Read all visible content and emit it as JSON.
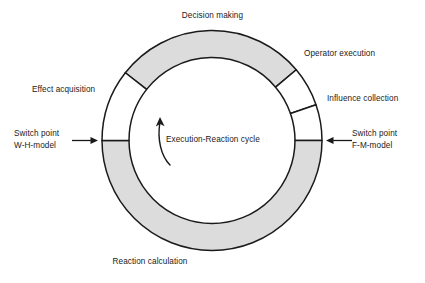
{
  "diagram": {
    "title": "Execution-Reaction cycle",
    "center_label": "Execution-Reaction cycle",
    "colors": {
      "segment_filled": "#dcdcdc",
      "segment_empty": "#ffffff",
      "stroke": "#1a1a1a",
      "text": "#1a1a1a",
      "background": "#ffffff"
    },
    "ring": {
      "center_x": 212,
      "center_y": 140.5,
      "outer_radius": 110,
      "inner_radius": 83
    },
    "rotation_direction": "counterclockwise",
    "segments": [
      {
        "id": "decision-making",
        "label": "Decision making",
        "fill": "filled",
        "start_angle": -142,
        "end_angle": -40
      },
      {
        "id": "operator-execution",
        "label": "Operator execution",
        "fill": "empty",
        "start_angle": -40,
        "end_angle": -19
      },
      {
        "id": "influence-collection",
        "label": "Influence collection",
        "fill": "empty",
        "start_angle": -19,
        "end_angle": 0
      },
      {
        "id": "reaction-calculation",
        "label": "Reaction calculation",
        "fill": "filled",
        "start_angle": 0,
        "end_angle": 180
      },
      {
        "id": "effect-acquisition",
        "label": "Effect acquisition",
        "fill": "empty",
        "start_angle": 180,
        "end_angle": 218
      }
    ],
    "switch_points": [
      {
        "id": "switch-point-left",
        "line1": "Switch point",
        "line2": "W-H-model",
        "arrow_direction": "right",
        "angle": 180
      },
      {
        "id": "switch-point-right",
        "line1": "Switch point",
        "line2": "F-M-model",
        "arrow_direction": "left",
        "angle": 0
      }
    ]
  }
}
